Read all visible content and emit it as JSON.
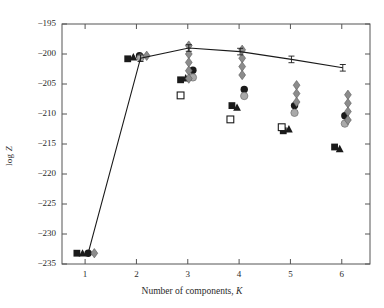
{
  "chart_data": {
    "type": "scatter",
    "title": "",
    "xlabel": "Number of components, K",
    "ylabel": "log Z",
    "xlim": [
      0.55,
      6.55
    ],
    "ylim": [
      -235,
      -195
    ],
    "xticks": [
      1,
      2,
      3,
      4,
      5,
      6
    ],
    "yticks": [
      -195,
      -200,
      -205,
      -210,
      -215,
      -220,
      -225,
      -230,
      -235
    ],
    "grid": false,
    "legend": "none",
    "series": [
      {
        "name": "nested-sampling-evidence-with-errorbars",
        "marker": "errorbar-line",
        "color": "#1a1a1a",
        "x": [
          1.06,
          2.08,
          3.02,
          4.02,
          5.02,
          6.02
        ],
        "y": [
          -233.2,
          -200.7,
          -199.0,
          -199.6,
          -200.9,
          -202.3
        ],
        "yerr": [
          0.0,
          0.55,
          0.55,
          0.55,
          0.55,
          0.55
        ],
        "connected": true
      },
      {
        "name": "filled-square",
        "marker": "filled-square",
        "color": "#1a1a1a",
        "x": [
          0.84,
          1.83,
          2.86,
          3.86,
          4.86,
          5.86
        ],
        "y": [
          -233.2,
          -200.8,
          -204.3,
          -208.6,
          -212.8,
          -215.5
        ]
      },
      {
        "name": "filled-triangle",
        "marker": "filled-triangle",
        "color": "#1a1a1a",
        "x": [
          0.95,
          1.94,
          2.96,
          3.96,
          4.97,
          5.96
        ],
        "y": [
          -233.2,
          -200.5,
          -204.0,
          -208.9,
          -212.5,
          -215.8
        ]
      },
      {
        "name": "open-square",
        "marker": "open-square",
        "color": "#1a1a1a",
        "x": [
          2.86,
          3.83,
          4.83
        ],
        "y": [
          -206.9,
          -210.9,
          -212.2
        ]
      },
      {
        "name": "filled-circle",
        "marker": "filled-circle",
        "color": "#1a1a1a",
        "x": [
          1.06,
          2.06,
          3.1,
          4.1,
          5.08,
          6.06
        ],
        "y": [
          -233.2,
          -200.3,
          -202.7,
          -205.9,
          -208.6,
          -210.3
        ]
      },
      {
        "name": "grey-circle",
        "marker": "grey-circle",
        "color": "#a9a9a9",
        "x": [
          2.08,
          3.1,
          4.1,
          5.08,
          6.06
        ],
        "y": [
          -200.6,
          -203.9,
          -207.0,
          -209.8,
          -211.6
        ]
      },
      {
        "name": "grey-diamond-chain",
        "marker": "grey-diamond",
        "color": "#8c8c8c",
        "x": [
          1.18,
          2.2,
          3.02,
          3.02,
          3.02,
          3.02,
          3.02,
          4.06,
          4.06,
          4.06,
          4.06,
          5.12,
          5.12,
          5.12,
          6.12,
          6.12,
          6.12,
          6.12
        ],
        "y": [
          -233.2,
          -200.3,
          -198.6,
          -200.0,
          -201.4,
          -202.8,
          -204.1,
          -199.3,
          -200.7,
          -202.1,
          -203.5,
          -205.2,
          -206.6,
          -208.0,
          -206.8,
          -208.2,
          -209.6,
          -211.0
        ]
      }
    ]
  },
  "axes": {
    "x_tick_labels": [
      "1",
      "2",
      "3",
      "4",
      "5",
      "6"
    ],
    "y_tick_labels": [
      "-195",
      "-200",
      "-205",
      "-210",
      "-215",
      "-220",
      "-225",
      "-230",
      "-235"
    ],
    "x_axis_title_prefix": "Number of components, ",
    "x_axis_title_symbol": "K",
    "y_axis_title_prefix": "log ",
    "y_axis_title_symbol": "Z"
  },
  "style": {
    "axis_color": "#555555",
    "marker_black": "#1a1a1a",
    "marker_grey": "#8c8c8c",
    "marker_light_grey": "#a9a9a9",
    "background": "#ffffff"
  }
}
